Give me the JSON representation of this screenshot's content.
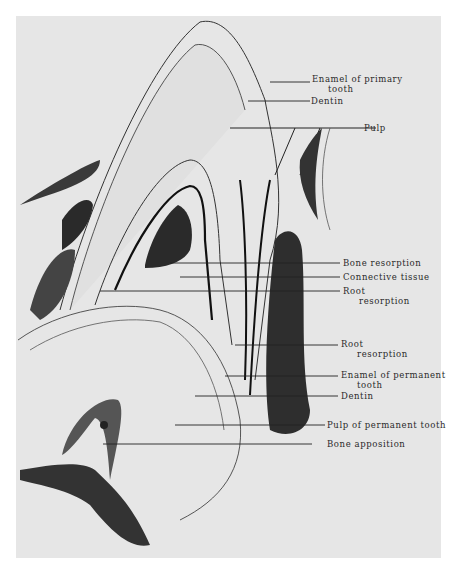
{
  "figure": {
    "background": "#e6e6e6",
    "ink": "#222222",
    "labels": [
      {
        "id": "enamel-primary",
        "line1": "Enamel of primary",
        "line2": "tooth",
        "x": 312,
        "y": 74
      },
      {
        "id": "dentin-top",
        "line1": "Dentin",
        "line2": "",
        "x": 311,
        "y": 95
      },
      {
        "id": "pulp",
        "line1": "Pulp",
        "line2": "",
        "x": 364,
        "y": 122
      },
      {
        "id": "bone-resorption",
        "line1": "Bone resorption",
        "line2": "",
        "x": 343,
        "y": 257
      },
      {
        "id": "connective-tissue",
        "line1": "Connective tissue",
        "line2": "",
        "x": 343,
        "y": 272
      },
      {
        "id": "root-resorption-1",
        "line1": "Root",
        "line2": "resorption",
        "x": 343,
        "y": 286
      },
      {
        "id": "root-resorption-2",
        "line1": "Root",
        "line2": "resorption",
        "x": 341,
        "y": 338
      },
      {
        "id": "enamel-permanent",
        "line1": "Enamel of permanent",
        "line2": "tooth",
        "x": 341,
        "y": 369
      },
      {
        "id": "dentin-bottom",
        "line1": "Dentin",
        "line2": "",
        "x": 341,
        "y": 390
      },
      {
        "id": "pulp-permanent",
        "line1": "Pulp of permanent tooth",
        "line2": "",
        "x": 327,
        "y": 420
      },
      {
        "id": "bone-apposition",
        "line1": "Bone apposition",
        "line2": "",
        "x": 327,
        "y": 440
      }
    ]
  }
}
